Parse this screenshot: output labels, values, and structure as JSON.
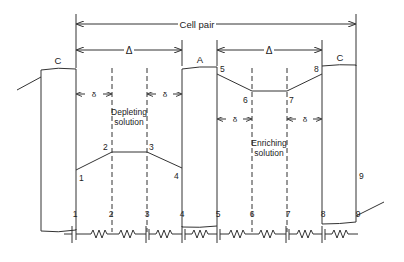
{
  "diagram": {
    "cell_pair_label": "Cell pair",
    "delta_label": "Δ",
    "delta_small_label": "δ",
    "membranes": [
      {
        "id": "left",
        "label": "C"
      },
      {
        "id": "middle",
        "label": "A"
      },
      {
        "id": "right",
        "label": "C"
      }
    ],
    "regions": {
      "depleting": {
        "line1": "Depleting",
        "line2": "solution"
      },
      "enriching": {
        "line1": "Enriching",
        "line2": "solution"
      }
    },
    "profile_points": [
      "1",
      "2",
      "3",
      "4",
      "5",
      "6",
      "7",
      "8",
      "9"
    ],
    "circuit_nodes": [
      "1",
      "2",
      "3",
      "4",
      "5",
      "6",
      "7",
      "8",
      "9"
    ]
  },
  "colors": {
    "line": "#333333",
    "text": "#222222",
    "background": "#ffffff"
  }
}
